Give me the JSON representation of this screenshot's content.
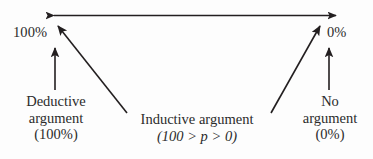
{
  "diagram": {
    "type": "argument-strength-continuum",
    "background_color": "#fdfdfd",
    "stroke_color": "#231f20",
    "endpoints": {
      "left_value": "100%",
      "right_value": "0%"
    },
    "labels": {
      "deductive": {
        "line1": "Deductive",
        "line2": "argument",
        "line3": "(100%)"
      },
      "no_argument": {
        "line1": "No",
        "line2": "argument",
        "line3": "(0%)"
      },
      "inductive": {
        "line1": "Inductive argument",
        "line2": "(100 > p > 0)"
      }
    },
    "connectors": [
      {
        "name": "horizontal-double-arrow",
        "from": "left-endpoint",
        "to": "right-endpoint",
        "arrowheads": "both"
      },
      {
        "name": "deductive-arrow",
        "from": "deductive-label",
        "to": "left-endpoint",
        "arrowheads": "end"
      },
      {
        "name": "no-argument-arrow",
        "from": "no-argument-label",
        "to": "right-endpoint",
        "arrowheads": "end"
      },
      {
        "name": "inductive-arrow-left",
        "from": "inductive-label",
        "to": "left-endpoint",
        "arrowheads": "end"
      },
      {
        "name": "inductive-arrow-right",
        "from": "inductive-label",
        "to": "right-endpoint",
        "arrowheads": "end"
      }
    ]
  }
}
